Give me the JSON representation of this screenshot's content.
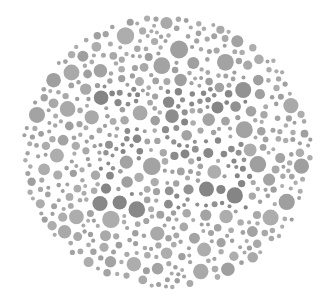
{
  "plate": {
    "type": "ishihara-style dot plate (grayscale)",
    "canvas": {
      "width": 331,
      "height": 298,
      "background": "#ffffff"
    },
    "ellipse": {
      "cx": 167,
      "cy": 152,
      "rx": 146,
      "ry": 138
    },
    "colors": {
      "background_dots": [
        "#a9a9a9",
        "#a3a3a3",
        "#adadad",
        "#9f9f9f"
      ],
      "figure_dots": [
        "#8c8c8c",
        "#888888",
        "#929292",
        "#858585"
      ]
    },
    "dot_radius_range": [
      2,
      9
    ],
    "seed": 7,
    "figure_regions": [
      {
        "shape": "left-figure",
        "x": [
          100,
          140
        ],
        "y": [
          85,
          210
        ]
      },
      {
        "shape": "right-figure",
        "x": [
          165,
          250
        ],
        "y": [
          88,
          210
        ]
      }
    ]
  }
}
